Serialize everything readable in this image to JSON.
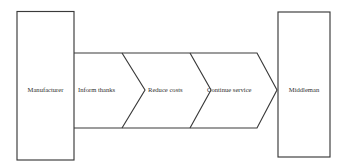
{
  "diagram": {
    "type": "process-flow-chevron",
    "title": "",
    "background_color": "#ffffff",
    "line_color": "#3a3a3a",
    "text_color": "#2e2e2e",
    "source_node": {
      "id": "manufacturer",
      "label": "Manufacturer",
      "shape": "rectangle"
    },
    "target_node": {
      "id": "middleman",
      "label": "Middleman",
      "shape": "rectangle"
    },
    "flow_steps": [
      {
        "id": "step-1",
        "label": "Inform thanks",
        "order": 1
      },
      {
        "id": "step-2",
        "label": "Reduce costs",
        "order": 2
      },
      {
        "id": "step-3",
        "label": "Continue service",
        "order": 3
      }
    ],
    "arrow": {
      "direction": "left-to-right",
      "head": "triangle",
      "segments": 3
    }
  }
}
